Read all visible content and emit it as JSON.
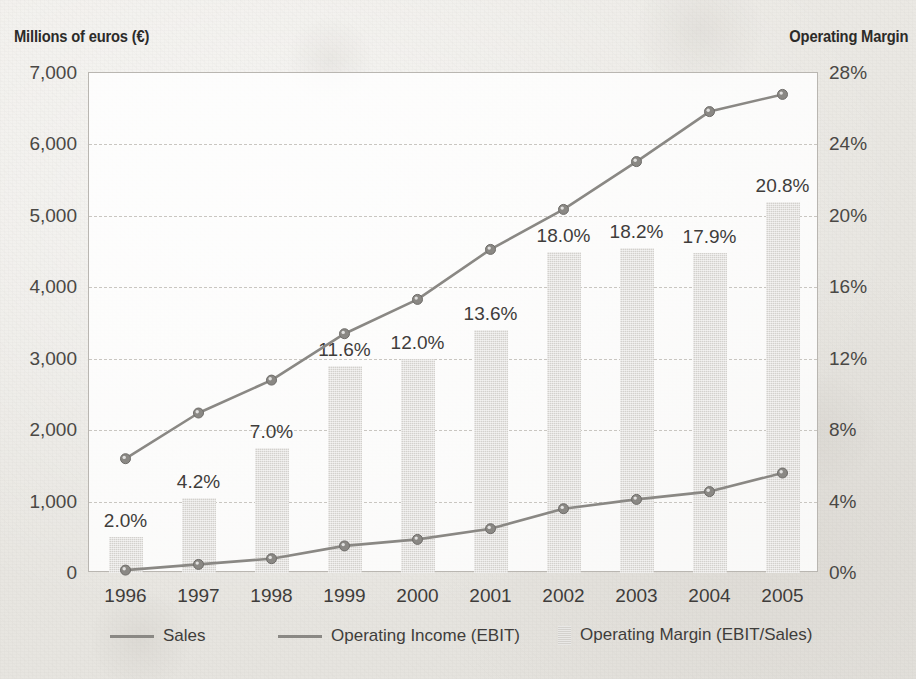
{
  "titles": {
    "left_axis": "Millions of euros (€)",
    "right_axis": "Operating Margin"
  },
  "legend": {
    "sales": "Sales",
    "ebit": "Operating Income (EBIT)",
    "margin": "Operating Margin (EBIT/Sales)"
  },
  "colors": {
    "bar": "#d3d1cd",
    "line": "#8a8884",
    "marker": "#8a8884",
    "text": "#3f3d3b",
    "grid": "#c9c6c1",
    "paper": "#eceae6"
  },
  "chart_data": {
    "type": "bar",
    "title": "",
    "subtitle": "",
    "xlabel": "",
    "ylabel": "Millions of euros (€)",
    "y2label": "Operating Margin",
    "categories": [
      "1996",
      "1997",
      "1998",
      "1999",
      "2000",
      "2001",
      "2002",
      "2003",
      "2004",
      "2005"
    ],
    "ylim": [
      0,
      7000
    ],
    "yticks": [
      0,
      1000,
      2000,
      3000,
      4000,
      5000,
      6000,
      7000
    ],
    "ytick_labels": [
      "0",
      "1,000",
      "2,000",
      "3,000",
      "4,000",
      "5,000",
      "6,000",
      "7,000"
    ],
    "y2lim": [
      0,
      28
    ],
    "y2ticks": [
      0,
      4,
      8,
      12,
      16,
      20,
      24,
      28
    ],
    "y2tick_labels": [
      "0%",
      "4%",
      "8%",
      "12%",
      "16%",
      "20%",
      "24%",
      "28%"
    ],
    "grid": true,
    "legend_position": "bottom",
    "series": [
      {
        "name": "Operating Margin (EBIT/Sales)",
        "type": "bar",
        "axis": "y2",
        "unit": "%",
        "values": [
          2.0,
          4.2,
          7.0,
          11.6,
          12.0,
          13.6,
          18.0,
          18.2,
          17.9,
          20.8
        ],
        "data_labels": [
          "2.0%",
          "4.2%",
          "7.0%",
          "11.6%",
          "12.0%",
          "13.6%",
          "18.0%",
          "18.2%",
          "17.9%",
          "20.8%"
        ]
      },
      {
        "name": "Sales",
        "type": "line",
        "axis": "y1",
        "unit": "millions of euros",
        "values": [
          1600,
          2240,
          2700,
          3350,
          3830,
          4530,
          5090,
          5760,
          6460,
          6700
        ]
      },
      {
        "name": "Operating Income (EBIT)",
        "type": "line",
        "axis": "y1",
        "unit": "millions of euros",
        "values": [
          40,
          120,
          200,
          380,
          470,
          620,
          900,
          1030,
          1140,
          1400
        ]
      }
    ]
  }
}
